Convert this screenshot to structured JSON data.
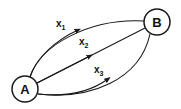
{
  "diagram": {
    "nodes": [
      {
        "id": "A",
        "label": "A"
      },
      {
        "id": "B",
        "label": "B"
      }
    ],
    "edges": [
      {
        "from": "A",
        "to": "B",
        "label": "x",
        "subscript": "1"
      },
      {
        "from": "A",
        "to": "B",
        "label": "x",
        "subscript": "2"
      },
      {
        "from": "A",
        "to": "B",
        "label": "x",
        "subscript": "3"
      }
    ],
    "colors": {
      "stroke": "#1a1a1a",
      "background": "#ffffff"
    }
  }
}
